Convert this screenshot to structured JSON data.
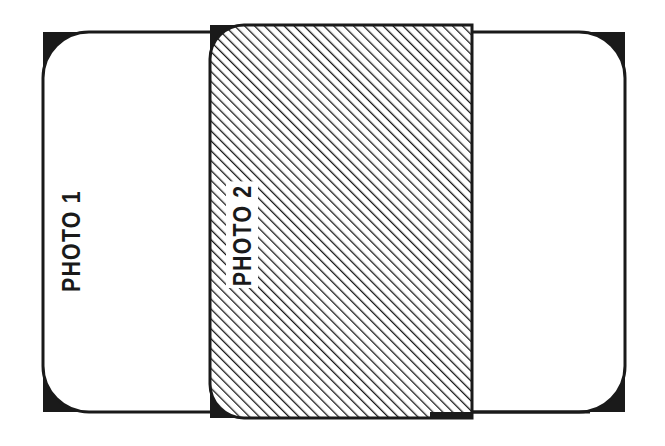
{
  "figure": {
    "type": "line-diagram",
    "background_color": "#ffffff",
    "ink_color": "#1a1a1a"
  },
  "photo1": {
    "label": "PHOTO 1",
    "label_rotation_deg": -90,
    "fill": "white",
    "stroke_color": "#1a1a1a",
    "stroke_width_px": 3,
    "corner_radius_px": 46,
    "corner_fill_color": "#1a1a1a",
    "bounds": {
      "x": 43,
      "y": 32,
      "width": 582,
      "height": 380
    },
    "filled_corners": [
      "top-left",
      "top-right",
      "bottom-left",
      "bottom-right"
    ]
  },
  "photo2": {
    "label": "PHOTO 2",
    "label_rotation_deg": -90,
    "label_background": "white",
    "fill": "diagonal-hatch",
    "hatch_angle_deg": 45,
    "hatch_spacing_px": 7,
    "hatch_line_width_px": 2.6,
    "hatch_color": "#1a1a1a",
    "stroke_color": "#1a1a1a",
    "corner_radius_px": 34,
    "corner_fill_color": "#1a1a1a",
    "bounds": {
      "x": 210,
      "y": 25,
      "width": 262,
      "height": 393
    },
    "filled_corners": [
      "top-left",
      "bottom-left"
    ],
    "square_corners": [
      "top-right",
      "bottom-right"
    ],
    "overlaps": "photo1"
  }
}
